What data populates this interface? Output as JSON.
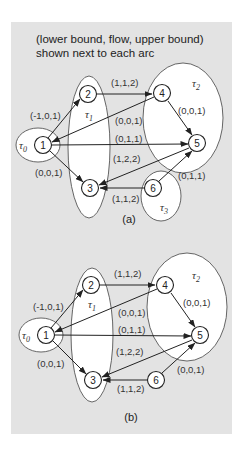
{
  "caption": {
    "line1": "(lower bound, flow, upper bound)",
    "line2": "shown next to each arc"
  },
  "diagrams": [
    {
      "label": "(a)",
      "nodes": [
        "1",
        "2",
        "3",
        "4",
        "5",
        "6"
      ],
      "sets": [
        {
          "name": "T0",
          "symbol": "τ",
          "sub": "0",
          "members": [
            "1"
          ]
        },
        {
          "name": "T1",
          "symbol": "τ",
          "sub": "1",
          "members": [
            "2",
            "3"
          ]
        },
        {
          "name": "T2",
          "symbol": "τ",
          "sub": "2",
          "members": [
            "4",
            "5"
          ]
        },
        {
          "name": "T3",
          "symbol": "τ",
          "sub": "3",
          "members": [
            "6"
          ]
        }
      ],
      "arcs": [
        {
          "from": "1",
          "to": "2",
          "label": "(-1,0,1)"
        },
        {
          "from": "2",
          "to": "4",
          "label": "(1,1,2)"
        },
        {
          "from": "4",
          "to": "1",
          "label": "(0,0,1)"
        },
        {
          "from": "1",
          "to": "5",
          "label": "(0,1,1)"
        },
        {
          "from": "4",
          "to": "5",
          "label": "(0,0,1)"
        },
        {
          "from": "5",
          "to": "3",
          "label": "(1,2,2)"
        },
        {
          "from": "1",
          "to": "3",
          "label": "(0,0,1)"
        },
        {
          "from": "6",
          "to": "5",
          "label": "(0,1,1)"
        },
        {
          "from": "6",
          "to": "3",
          "label": "(1,1,2)"
        }
      ]
    },
    {
      "label": "(b)",
      "nodes": [
        "1",
        "2",
        "3",
        "4",
        "5",
        "6"
      ],
      "sets": [
        {
          "name": "T0",
          "symbol": "τ",
          "sub": "0",
          "members": [
            "1"
          ]
        },
        {
          "name": "T1",
          "symbol": "τ",
          "sub": "1",
          "members": [
            "2",
            "3"
          ]
        },
        {
          "name": "T2",
          "symbol": "τ",
          "sub": "2",
          "members": [
            "4",
            "5"
          ]
        }
      ],
      "arcs": [
        {
          "from": "1",
          "to": "2",
          "label": "(-1,0,1)"
        },
        {
          "from": "2",
          "to": "4",
          "label": "(1,1,2)"
        },
        {
          "from": "4",
          "to": "1",
          "label": "(0,0,1)"
        },
        {
          "from": "1",
          "to": "5",
          "label": "(0,1,1)"
        },
        {
          "from": "4",
          "to": "5",
          "label": "(0,0,1)"
        },
        {
          "from": "5",
          "to": "3",
          "label": "(1,2,2)"
        },
        {
          "from": "1",
          "to": "3",
          "label": "(0,0,1)"
        },
        {
          "from": "6",
          "to": "5",
          "label": "(0,0,1)"
        },
        {
          "from": "6",
          "to": "3",
          "label": "(1,1,2)"
        }
      ]
    }
  ],
  "colors": {
    "panel": "#e3e3e3",
    "ellipse_fill": "#ffffff",
    "stroke": "#222222"
  }
}
